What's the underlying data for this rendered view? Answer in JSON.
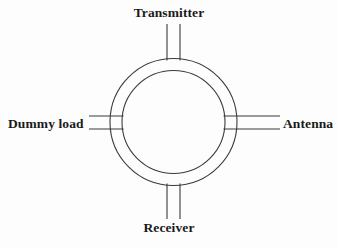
{
  "figure": {
    "kind": "circulator-block-diagram",
    "background_color": "#fdfdfd",
    "line_color": "#3a3a3a",
    "text_color": "#1a1a1a"
  },
  "ports": {
    "top": {
      "label": "Transmitter",
      "icon": "port-stub-icon"
    },
    "bottom": {
      "label": "Receiver",
      "icon": "port-stub-icon"
    },
    "left": {
      "label": "Dummy load",
      "icon": "port-stub-icon"
    },
    "right": {
      "label": "Antenna",
      "icon": "port-stub-icon"
    }
  },
  "ring": {
    "center_x": 173.5,
    "center_y": 122,
    "outer_radius": 63.5,
    "inner_radius": 51.5
  }
}
